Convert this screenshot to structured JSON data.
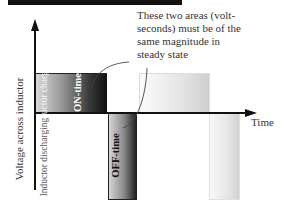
{
  "diagram": {
    "title_bar_color": "#111111",
    "annotation": {
      "lines": [
        "These two areas (volt-",
        "seconds) must be of the",
        "same magnitude in",
        "steady state"
      ]
    },
    "axes": {
      "y_label": "Voltage across inductor",
      "x_label": "Time"
    },
    "regions": {
      "charging_label": "Inductor charging",
      "discharging_label": "Inductor discharging",
      "on_label": "ON-time",
      "off_label": "OFF-time"
    },
    "colors": {
      "axis": "#111111",
      "on_dark": "#101010",
      "off_dark": "#222222",
      "ghost": "#d2d2d2"
    }
  }
}
